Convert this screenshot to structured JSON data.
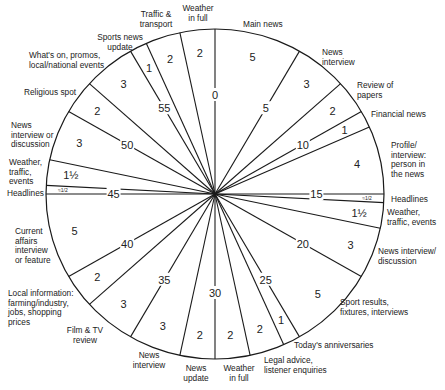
{
  "chart_data": {
    "type": "pie",
    "center": [
      215,
      194
    ],
    "radius": [
      169,
      165
    ],
    "minute_marks": [
      {
        "minute": 0,
        "label": "0"
      },
      {
        "minute": 5,
        "label": "5"
      },
      {
        "minute": 10,
        "label": "10"
      },
      {
        "minute": 15,
        "label": "15"
      },
      {
        "minute": 20,
        "label": "20"
      },
      {
        "minute": 25,
        "label": "25"
      },
      {
        "minute": 30,
        "label": "30"
      },
      {
        "minute": 35,
        "label": "35"
      },
      {
        "minute": 40,
        "label": "40"
      },
      {
        "minute": 45,
        "label": "45"
      },
      {
        "minute": 50,
        "label": "50"
      },
      {
        "minute": 55,
        "label": "55"
      }
    ],
    "segments": [
      {
        "name": "Main news",
        "start": 0,
        "duration": 5,
        "duration_label": "5"
      },
      {
        "name": "News interview",
        "start": 5,
        "duration": 3,
        "duration_label": "3"
      },
      {
        "name": "Review of papers",
        "start": 8,
        "duration": 2,
        "duration_label": "2"
      },
      {
        "name": "Financial news",
        "start": 10,
        "duration": 1,
        "duration_label": "1"
      },
      {
        "name": "Profile/ interview: person in the news",
        "start": 11,
        "duration": 4,
        "duration_label": "4"
      },
      {
        "name": "Headlines",
        "start": 15,
        "duration": 0.5,
        "duration_label": "≈1/2"
      },
      {
        "name": "Weather, traffic, events",
        "start": 15.5,
        "duration": 1.5,
        "duration_label": "1½"
      },
      {
        "name": "News interview/ discussion",
        "start": 17,
        "duration": 3,
        "duration_label": "3"
      },
      {
        "name": "Sport results, fixtures, interviews",
        "start": 20,
        "duration": 5,
        "duration_label": "5"
      },
      {
        "name": "Today's anniversaries",
        "start": 25,
        "duration": 1,
        "duration_label": "1"
      },
      {
        "name": "Legal advice, listener enquiries",
        "start": 26,
        "duration": 2,
        "duration_label": "2"
      },
      {
        "name": "Weather in full",
        "start": 28,
        "duration": 2,
        "duration_label": "2"
      },
      {
        "name": "News update",
        "start": 30,
        "duration": 2,
        "duration_label": "2"
      },
      {
        "name": "News interview",
        "start": 32,
        "duration": 3,
        "duration_label": "3"
      },
      {
        "name": "Film & TV review",
        "start": 35,
        "duration": 3,
        "duration_label": "3"
      },
      {
        "name": "Local information: farming/industry, jobs, shopping prices",
        "start": 38,
        "duration": 2,
        "duration_label": "2"
      },
      {
        "name": "Current affairs interview or feature",
        "start": 40,
        "duration": 5,
        "duration_label": "5"
      },
      {
        "name": "Headlines",
        "start": 45,
        "duration": 0.5,
        "duration_label": "≈1/2"
      },
      {
        "name": "Weather, traffic, events",
        "start": 45.5,
        "duration": 1.5,
        "duration_label": "1½"
      },
      {
        "name": "News interview or discussion",
        "start": 47,
        "duration": 3,
        "duration_label": "3"
      },
      {
        "name": "Religious spot",
        "start": 50,
        "duration": 2,
        "duration_label": "2"
      },
      {
        "name": "What's on, promos, local/national events",
        "start": 52,
        "duration": 3,
        "duration_label": "3"
      },
      {
        "name": "Sports news update",
        "start": 55,
        "duration": 1,
        "duration_label": "1"
      },
      {
        "name": "Traffic & transport",
        "start": 56,
        "duration": 2,
        "duration_label": "2"
      },
      {
        "name": "Weather in full",
        "start": 58,
        "duration": 2,
        "duration_label": "2"
      }
    ]
  },
  "labels": {
    "main_news": "Main news",
    "news_interview_1": "News\ninterview",
    "review_papers": "Review of\npapers",
    "financial_news": "Financial news",
    "profile": "Profile/\ninterview:\nperson in\nthe news",
    "headlines_right": "Headlines",
    "weather_traffic_right": "Weather,\ntraffic, events",
    "news_interview_discussion": "News interview/\ndiscussion",
    "sport_results": "Sport results,\nfixtures, interviews",
    "anniversaries": "Today's anniversaries",
    "legal_advice": "Legal advice,\nlistener enquiries",
    "weather_full_bottom": "Weather\nin full",
    "news_update": "News\nupdate",
    "news_interview_2": "News\ninterview",
    "film_tv": "Film & TV\nreview",
    "local_info": "Local information:\nfarming/industry,\njobs, shopping\nprices",
    "current_affairs": "Current\naffairs\ninterview\nor feature",
    "headlines_left": "Headlines",
    "weather_traffic_left": "Weather,\ntraffic,\nevents",
    "news_interview_or_discussion": "News\ninterview or\ndiscussion",
    "religious_spot": "Religious spot",
    "whats_on": "What's on, promos,\nlocal/national events",
    "sports_news_update": "Sports news\nupdate",
    "traffic_transport": "Traffic &\ntransport",
    "weather_full_top": "Weather\nin full"
  }
}
